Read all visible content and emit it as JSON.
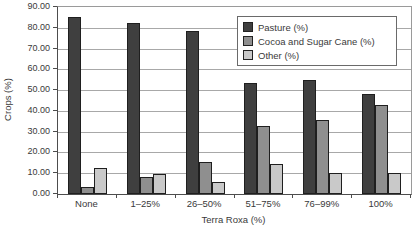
{
  "chart_data": {
    "type": "bar",
    "title": "",
    "xlabel": "Terra Roxa (%)",
    "ylabel": "Crops (%)",
    "categories": [
      "None",
      "1–25%",
      "26–50%",
      "51–75%",
      "76–99%",
      "100%"
    ],
    "series": [
      {
        "name": "Pasture (%)",
        "color": "#3f3f3f",
        "values": [
          85,
          82.5,
          78.5,
          53.5,
          55,
          48
        ]
      },
      {
        "name": "Cocoa and Sugar Cane (%)",
        "color": "#8f8f8f",
        "values": [
          3.5,
          8,
          15.5,
          32.5,
          35.5,
          43
        ]
      },
      {
        "name": "Other (%)",
        "color": "#c9c9c9",
        "values": [
          12.5,
          9.5,
          6,
          14.5,
          10,
          10
        ]
      }
    ],
    "ylim": [
      0,
      90
    ],
    "ytick_step": 10,
    "yticks": [
      "0.00",
      "10.00",
      "20.00",
      "30.00",
      "40.00",
      "50.00",
      "60.00",
      "70.00",
      "80.00",
      "90.00"
    ],
    "grid": "horizontal",
    "legend_position": "top-right",
    "plot_border_color": "#9a9a9a",
    "gridline_color": "#a8a8a8",
    "background_color": "#ffffff"
  }
}
